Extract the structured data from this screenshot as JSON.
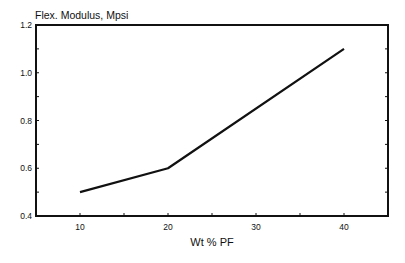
{
  "chart_data": {
    "type": "line",
    "title": "Flex. Modulus, Mpsi",
    "xlabel": "Wt % PF",
    "ylabel": "Flex. Modulus, Mpsi",
    "x": [
      10,
      20,
      30,
      40
    ],
    "series": [
      {
        "name": "Flex. Modulus",
        "x": [
          10,
          20,
          40
        ],
        "values": [
          0.5,
          0.6,
          1.1
        ]
      }
    ],
    "xlim": [
      5,
      45
    ],
    "ylim": [
      0.4,
      1.2
    ],
    "xticks": [
      10,
      20,
      30,
      40
    ],
    "xtick_labels": [
      "10",
      "20",
      "30",
      "40"
    ],
    "yticks": [
      0.4,
      0.6,
      0.8,
      1.0,
      1.2
    ],
    "ytick_labels": [
      "0.4",
      "0.6",
      "0.8",
      "1.0",
      "1.2"
    ],
    "grid": false,
    "legend": null
  }
}
